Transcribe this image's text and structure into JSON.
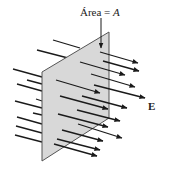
{
  "figure": {
    "type": "electric-flux-diagram",
    "area_label_prefix": "Área = ",
    "area_label_var": "A",
    "field_label": "E",
    "colors": {
      "panel_fill": "#d8d8d8",
      "panel_edge": "#555555",
      "arrow": "#1a1a1a",
      "background": "#ffffff"
    }
  }
}
